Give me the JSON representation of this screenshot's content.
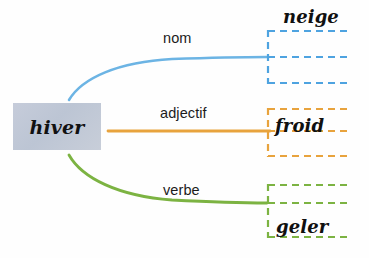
{
  "diagram": {
    "type": "word-family-mind-map",
    "language": "French",
    "root": {
      "word": "hiver",
      "box_color": "#c3cad8"
    },
    "branches": [
      {
        "id": "nom",
        "label": "nom",
        "color": "#6cb4e4",
        "connector": "curve",
        "answer": "neige",
        "writing_lines": 3
      },
      {
        "id": "adjectif",
        "label": "adjectif",
        "color": "#e8a33d",
        "connector": "straight",
        "answer": "froid",
        "writing_lines": 3
      },
      {
        "id": "verbe",
        "label": "verbe",
        "color": "#7cb342",
        "connector": "curve",
        "answer": "geler",
        "writing_lines": 3
      }
    ]
  },
  "colors": {
    "blue": "#6cb4e4",
    "orange": "#e8a33d",
    "green": "#7cb342",
    "root_box": "#c3cad8",
    "text": "#1c1c1c",
    "background": "#ffffff"
  }
}
